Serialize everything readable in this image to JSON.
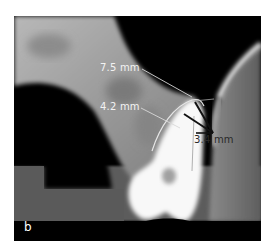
{
  "figure": {
    "panel_letter": "b",
    "measurements": [
      {
        "id": "m1",
        "label": "7.5 mm"
      },
      {
        "id": "m2",
        "label": "4.2 mm"
      },
      {
        "id": "m3",
        "label": "3.4 mm"
      }
    ],
    "colors": {
      "background": "#000000",
      "bone_light": "#c8c8c8",
      "soft_tissue": "#6a6a6a",
      "tooth": "#ffffff",
      "annotation_light": "#f2f2f2",
      "annotation_dark": "#1a1a1a"
    }
  }
}
